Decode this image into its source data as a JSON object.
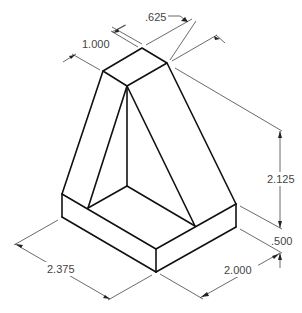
{
  "drawing": {
    "type": "isometric-part-drawing",
    "line_color": "#111111",
    "dimension_color": "#444444",
    "dimensions": {
      "top_width": ".625",
      "top_depth": "1.000",
      "height": "2.125",
      "base_thickness": ".500",
      "base_width": "2.000",
      "base_depth": "2.375"
    }
  }
}
